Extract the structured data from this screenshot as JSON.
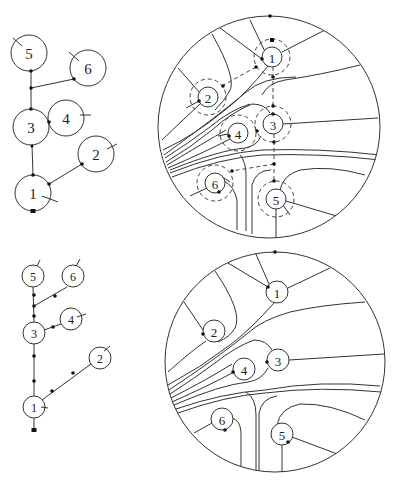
{
  "figure": {
    "panels": [
      {
        "id": "top-left-tree",
        "node_radius": 18,
        "font_size": 15,
        "nodes": [
          {
            "label": "5",
            "x": 29,
            "y": 53,
            "tick": [
              [
                13,
                36
              ],
              [
                22,
                45
              ]
            ]
          },
          {
            "label": "6",
            "x": 88,
            "y": 68,
            "tick": [
              [
                69,
                51
              ],
              [
                80,
                61
              ]
            ]
          },
          {
            "label": "3",
            "x": 31,
            "y": 127,
            "tick": null
          },
          {
            "label": "4",
            "x": 66,
            "y": 118,
            "tick": [
              [
                78,
                115
              ],
              [
                90,
                115
              ]
            ]
          },
          {
            "label": "2",
            "x": 96,
            "y": 154,
            "tick": [
              [
                106,
                150
              ],
              [
                117,
                144
              ]
            ]
          },
          {
            "label": "1",
            "x": 33,
            "y": 193,
            "tick": [
              [
                42,
                196
              ],
              [
                58,
                202
              ]
            ]
          }
        ],
        "edges": [
          [
            [
              31,
              71
            ],
            [
              31,
              88
            ]
          ],
          [
            [
              31,
              88
            ],
            [
              74,
              79
            ]
          ],
          [
            [
              31,
              88
            ],
            [
              31,
              109
            ]
          ],
          [
            [
              49,
              122
            ],
            [
              48,
              122
            ]
          ],
          [
            [
              31,
              145
            ],
            [
              33,
              175
            ]
          ],
          [
            [
              33,
              175
            ],
            [
              33,
              176
            ]
          ],
          [
            [
              50,
              184
            ],
            [
              82,
              164
            ]
          ]
        ],
        "dots": [
          [
            31,
            71
          ],
          [
            31,
            88
          ],
          [
            74,
            79
          ],
          [
            31,
            109
          ],
          [
            49,
            122
          ],
          [
            32,
            146
          ],
          [
            33,
            175
          ],
          [
            49,
            184
          ],
          [
            82,
            164
          ]
        ],
        "squares": [
          [
            33,
            211
          ]
        ]
      },
      {
        "id": "bottom-left-tree",
        "node_radius": 11,
        "font_size": 12,
        "nodes": [
          {
            "label": "5",
            "x": 33,
            "y": 276,
            "tick": [
              [
                37,
                266
              ],
              [
                40,
                260
              ]
            ]
          },
          {
            "label": "6",
            "x": 73,
            "y": 276,
            "tick": [
              [
                76,
                266
              ],
              [
                80,
                259
              ]
            ]
          },
          {
            "label": "4",
            "x": 71,
            "y": 319,
            "tick": [
              [
                77,
                317
              ],
              [
                86,
                314
              ]
            ]
          },
          {
            "label": "3",
            "x": 34,
            "y": 333,
            "tick": null
          },
          {
            "label": "2",
            "x": 100,
            "y": 358,
            "tick": [
              [
                104,
                351
              ],
              [
                110,
                346
              ]
            ]
          },
          {
            "label": "1",
            "x": 34,
            "y": 407,
            "tick": [
              [
                41,
                407
              ],
              [
                48,
                408
              ]
            ]
          }
        ],
        "edges": [
          [
            [
              33,
              287
            ],
            [
              34,
              322
            ]
          ],
          [
            [
              34,
              306
            ],
            [
              67,
              287
            ]
          ],
          [
            [
              45,
              329
            ],
            [
              61,
              324
            ]
          ],
          [
            [
              34,
              344
            ],
            [
              34,
              396
            ]
          ],
          [
            [
              42,
              399
            ],
            [
              91,
              364
            ]
          ],
          [
            [
              34,
              418
            ],
            [
              34,
              430
            ]
          ]
        ],
        "dots": [
          [
            34,
            295
          ],
          [
            34,
            306
          ],
          [
            34,
            316
          ],
          [
            55,
            295
          ],
          [
            53,
            327
          ],
          [
            34,
            356
          ],
          [
            34,
            381
          ],
          [
            52,
            391
          ],
          [
            73,
            373
          ]
        ],
        "squares": [
          [
            34,
            430
          ]
        ]
      },
      {
        "id": "top-disk-embedding",
        "disk": {
          "cx": 269,
          "cy": 127,
          "r": 111
        },
        "node_radius": 10,
        "halo_radius": 18,
        "font_size": 13,
        "nodes": [
          {
            "label": "1",
            "x": 272,
            "y": 57
          },
          {
            "label": "2",
            "x": 208,
            "y": 97
          },
          {
            "label": "3",
            "x": 273,
            "y": 124
          },
          {
            "label": "4",
            "x": 238,
            "y": 133
          },
          {
            "label": "6",
            "x": 215,
            "y": 183
          },
          {
            "label": "5",
            "x": 276,
            "y": 199
          }
        ],
        "dashed_path": [
          [
            256,
            67
          ],
          [
            222,
            86
          ]
        ],
        "dashed_trunk": [
          [
            273,
            77
          ],
          [
            273,
            106
          ]
        ],
        "dashed_trunk2": [
          [
            274,
            142
          ],
          [
            274,
            181
          ]
        ],
        "dashed_branch": [
          [
            274,
            164
          ],
          [
            232,
            171
          ]
        ],
        "dots": [
          [
            270,
            16
          ],
          [
            262,
            59
          ],
          [
            256,
            67
          ],
          [
            273,
            77
          ],
          [
            223,
            86
          ],
          [
            199,
            101
          ],
          [
            273,
            106
          ],
          [
            273,
            114
          ],
          [
            257,
            131
          ],
          [
            229,
            136
          ],
          [
            274,
            142
          ],
          [
            274,
            164
          ],
          [
            232,
            171
          ],
          [
            274,
            181
          ],
          [
            219,
            192
          ]
        ],
        "squares": [
          [
            272,
            40
          ]
        ]
      },
      {
        "id": "bottom-disk-embedding",
        "disk": {
          "cx": 275,
          "cy": 362,
          "r": 110
        },
        "node_radius": 11,
        "font_size": 13,
        "nodes": [
          {
            "label": "1",
            "x": 277,
            "y": 292
          },
          {
            "label": "2",
            "x": 214,
            "y": 331
          },
          {
            "label": "3",
            "x": 278,
            "y": 360
          },
          {
            "label": "4",
            "x": 244,
            "y": 369
          },
          {
            "label": "6",
            "x": 222,
            "y": 419
          },
          {
            "label": "5",
            "x": 282,
            "y": 434
          }
        ],
        "dots": [
          [
            275,
            252
          ],
          [
            268,
            287
          ],
          [
            203,
            334
          ],
          [
            267,
            362
          ],
          [
            233,
            372
          ],
          [
            225,
            430
          ],
          [
            288,
            442
          ]
        ]
      }
    ]
  }
}
